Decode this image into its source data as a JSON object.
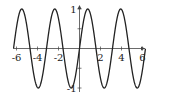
{
  "chart_data": {
    "type": "line",
    "title": "",
    "xlabel": "",
    "ylabel": "",
    "function": "y = sin(2x)",
    "xlim": [
      -6.28,
      6.28
    ],
    "ylim": [
      -1,
      1
    ],
    "grid": false,
    "legend": null,
    "x_ticks": [
      -6,
      -4,
      -2,
      2,
      4,
      6
    ],
    "x_tick_labels": [
      "-6",
      "-4",
      "-2",
      "2",
      "4",
      "6"
    ],
    "y_ticks": [
      1,
      0.5,
      -0.5,
      -1
    ],
    "y_tick_labels": [
      "1",
      "",
      "",
      "-1"
    ],
    "series": [
      {
        "name": "sin(2x)",
        "x": [
          -6.28,
          -5.5,
          -4.71,
          -3.93,
          -3.14,
          -2.36,
          -1.57,
          -0.79,
          0,
          0.79,
          1.57,
          2.36,
          3.14,
          3.93,
          4.71,
          5.5,
          6.28
        ],
        "y": [
          0,
          1,
          0,
          -1,
          0,
          1,
          0,
          -1,
          0,
          1,
          0,
          -1,
          0,
          1,
          0,
          -1,
          0
        ]
      }
    ],
    "colors": {
      "curve": "#222222",
      "axes": "#444444"
    }
  }
}
